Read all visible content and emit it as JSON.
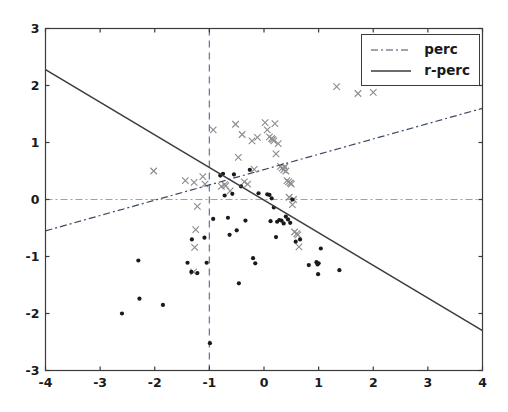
{
  "figure": {
    "background_color": "#ffffff",
    "axes_color": "#3b3b3b",
    "tick_label_color": "#1a1a1a"
  },
  "legend": {
    "position": "upper-right",
    "entries": [
      {
        "label": "perc",
        "style": "dashdot",
        "color": "#3b4a63",
        "name": "legend-entry-perc"
      },
      {
        "label": "r-perc",
        "style": "solid",
        "color": "#3b3b3b",
        "name": "legend-entry-r-perc"
      }
    ]
  },
  "chart_data": {
    "type": "scatter",
    "title": "",
    "xlabel": "",
    "ylabel": "",
    "xlim": [
      -4,
      4
    ],
    "ylim": [
      -3,
      3
    ],
    "xticks": [
      -4,
      -3,
      -2,
      -1,
      0,
      1,
      2,
      3,
      4
    ],
    "yticks": [
      -3,
      -2,
      -1,
      0,
      1,
      2,
      3
    ],
    "xticklabels": [
      "-4",
      "-3",
      "-2",
      "-1",
      "0",
      "1",
      "2",
      "3",
      "4"
    ],
    "yticklabels": [
      "-3",
      "-2",
      "-1",
      "0",
      "1",
      "2",
      "3"
    ],
    "grid": false,
    "reference_lines": [
      {
        "name": "zero-horizontal-line",
        "orientation": "horizontal",
        "value": 0,
        "style": "dashdot",
        "color": "#8fa3c8",
        "width": 1.0
      },
      {
        "name": "threshold-vertical-line",
        "orientation": "vertical",
        "value": -1,
        "style": "dashed",
        "color": "#6b7c99",
        "width": 1.3
      }
    ],
    "fit_lines": [
      {
        "name": "perc",
        "label": "perc",
        "style": "dashdot",
        "color": "#3b4a63",
        "width": 1.2,
        "x0": -4,
        "y0": -0.55,
        "x1": 4,
        "y1": 1.6,
        "slope": 0.269,
        "intercept": 0.525
      },
      {
        "name": "r-perc",
        "label": "r-perc",
        "style": "solid",
        "color": "#3b3b3b",
        "width": 1.5,
        "x0": -4,
        "y0": 2.28,
        "x1": 4,
        "y1": -2.3,
        "slope": -0.5725,
        "intercept": -0.01
      }
    ],
    "series": [
      {
        "name": "class-cross",
        "marker": "x",
        "color": "#8d8d8d",
        "size": 6.5,
        "points": [
          [
            -2.02,
            0.5
          ],
          [
            -1.44,
            0.33
          ],
          [
            -1.28,
            0.3
          ],
          [
            -1.22,
            -0.12
          ],
          [
            -1.25,
            -0.53
          ],
          [
            -1.27,
            -0.84
          ],
          [
            -1.29,
            -1.27
          ],
          [
            -1.12,
            0.4
          ],
          [
            -1.08,
            0.27
          ],
          [
            -0.93,
            1.22
          ],
          [
            -0.78,
            0.23
          ],
          [
            -0.72,
            0.26
          ],
          [
            -0.7,
            0.24
          ],
          [
            -0.62,
            0.15
          ],
          [
            -0.52,
            1.32
          ],
          [
            -0.47,
            0.74
          ],
          [
            -0.4,
            1.14
          ],
          [
            -0.36,
            0.31
          ],
          [
            -0.3,
            0.27
          ],
          [
            -0.22,
            1.03
          ],
          [
            -0.18,
            0.53
          ],
          [
            -0.12,
            1.09
          ],
          [
            0.02,
            1.35
          ],
          [
            0.06,
            1.22
          ],
          [
            0.1,
            1.1
          ],
          [
            0.14,
            1.07
          ],
          [
            0.16,
            1.05
          ],
          [
            0.18,
            1.03
          ],
          [
            0.2,
            1.33
          ],
          [
            0.22,
            0.8
          ],
          [
            0.26,
            0.98
          ],
          [
            0.3,
            0.58
          ],
          [
            0.33,
            0.55
          ],
          [
            0.36,
            0.52
          ],
          [
            0.38,
            0.57
          ],
          [
            0.4,
            0.5
          ],
          [
            0.42,
            0.33
          ],
          [
            0.45,
            0.31
          ],
          [
            0.48,
            0.29
          ],
          [
            0.5,
            0.27
          ],
          [
            0.46,
            0.04
          ],
          [
            0.52,
            -0.09
          ],
          [
            0.54,
            0.0
          ],
          [
            0.56,
            -0.57
          ],
          [
            0.6,
            -0.6
          ],
          [
            0.62,
            -0.62
          ],
          [
            0.64,
            -0.83
          ],
          [
            1.33,
            1.98
          ],
          [
            1.72,
            1.86
          ],
          [
            2.0,
            1.88
          ]
        ]
      },
      {
        "name": "class-dot",
        "marker": "o",
        "color": "#1a1a1a",
        "size": 4.2,
        "points": [
          [
            -2.6,
            -2.0
          ],
          [
            -2.28,
            -1.74
          ],
          [
            -2.3,
            -1.07
          ],
          [
            -1.85,
            -1.85
          ],
          [
            -1.32,
            -0.7
          ],
          [
            -1.33,
            -1.27
          ],
          [
            -1.22,
            -1.29
          ],
          [
            -1.4,
            -1.11
          ],
          [
            -1.09,
            -0.67
          ],
          [
            -1.05,
            -1.11
          ],
          [
            -0.99,
            -2.52
          ],
          [
            -0.93,
            -0.34
          ],
          [
            -0.8,
            0.42
          ],
          [
            -0.75,
            0.45
          ],
          [
            -0.72,
            0.07
          ],
          [
            -0.66,
            -0.32
          ],
          [
            -0.63,
            -0.62
          ],
          [
            -0.58,
            0.1
          ],
          [
            -0.55,
            0.44
          ],
          [
            -0.5,
            -0.54
          ],
          [
            -0.46,
            -1.47
          ],
          [
            -0.42,
            0.23
          ],
          [
            -0.34,
            -0.37
          ],
          [
            -0.26,
            0.52
          ],
          [
            -0.2,
            -1.03
          ],
          [
            -0.16,
            -1.12
          ],
          [
            -0.1,
            0.11
          ],
          [
            0.06,
            0.09
          ],
          [
            0.1,
            0.08
          ],
          [
            0.14,
            0.02
          ],
          [
            0.12,
            -0.38
          ],
          [
            0.18,
            -0.14
          ],
          [
            0.24,
            -0.39
          ],
          [
            0.28,
            -0.36
          ],
          [
            0.32,
            -0.37
          ],
          [
            0.22,
            -0.66
          ],
          [
            0.36,
            -0.42
          ],
          [
            0.4,
            -0.3
          ],
          [
            0.44,
            -0.35
          ],
          [
            0.48,
            -0.41
          ],
          [
            0.52,
            0.0
          ],
          [
            0.58,
            -0.74
          ],
          [
            0.66,
            -0.7
          ],
          [
            0.82,
            -1.15
          ],
          [
            0.96,
            -1.1
          ],
          [
            0.98,
            -1.14
          ],
          [
            1.0,
            -1.12
          ],
          [
            0.99,
            -1.31
          ],
          [
            1.04,
            -0.86
          ],
          [
            1.38,
            -1.24
          ]
        ]
      }
    ]
  }
}
